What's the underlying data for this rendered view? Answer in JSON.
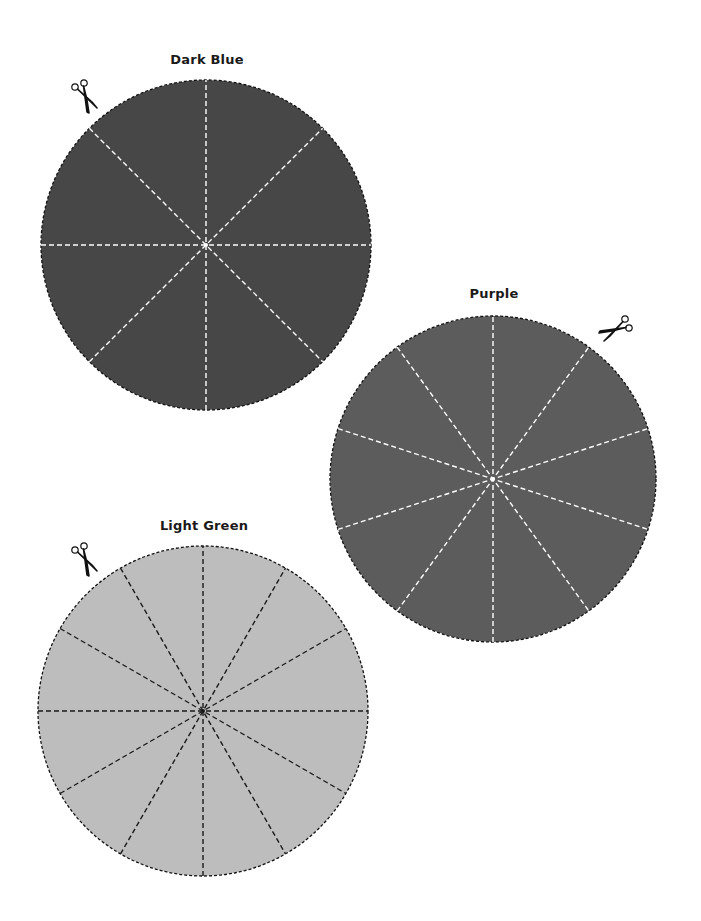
{
  "circles": [
    {
      "id": "dark-blue",
      "label": "Dark Blue",
      "cx": 206,
      "cy": 245,
      "r": 165,
      "fill": "#474747",
      "line_color": "#ffffff",
      "segments": 8,
      "title_pos": [
        207,
        59
      ],
      "scissors": {
        "x": 87,
        "y": 100,
        "rotate": 0
      }
    },
    {
      "id": "purple",
      "label": "Purple",
      "cx": 493,
      "cy": 479,
      "r": 163,
      "fill": "#5c5c5c",
      "line_color": "#ffffff",
      "segments": 10,
      "title_pos": [
        494,
        293
      ],
      "scissors": {
        "x": 612,
        "y": 331,
        "rotate": 90
      }
    },
    {
      "id": "light-green",
      "label": "Light Green",
      "cx": 203,
      "cy": 711,
      "r": 165,
      "fill": "#bdbdbd",
      "line_color": "#1a1a1a",
      "segments": 12,
      "title_pos": [
        204,
        525
      ],
      "scissors": {
        "x": 87,
        "y": 563,
        "rotate": 0
      }
    }
  ],
  "icons": {
    "scissors": "scissors-icon"
  }
}
